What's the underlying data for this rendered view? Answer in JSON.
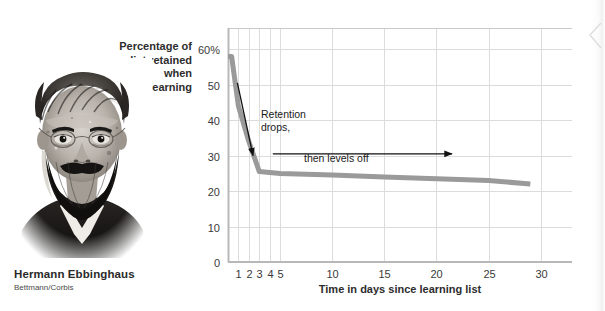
{
  "figure": {
    "portrait": {
      "alt": "portrait-hermann-ebbinghaus",
      "caption_name": "Hermann Ebbinghaus",
      "caption_credit": "Bettmann/Corbis"
    }
  },
  "chart_data": {
    "type": "line",
    "title": "",
    "xlabel": "Time in days since learning list",
    "ylabel": "Percentage of list retained when relearning",
    "ylabel_lines": [
      "Percentage of",
      "list retained",
      "when",
      "relearning"
    ],
    "xlim": [
      0,
      33
    ],
    "ylim": [
      0,
      66
    ],
    "grid": true,
    "legend": "none",
    "ytick_values": [
      0,
      10,
      20,
      30,
      40,
      50,
      60
    ],
    "ytick_labels": [
      "0",
      "10",
      "20",
      "30",
      "40",
      "50",
      "60%"
    ],
    "xtick_values": [
      1,
      2,
      3,
      4,
      5,
      10,
      15,
      20,
      25,
      30
    ],
    "xtick_labels": [
      "1",
      "2",
      "3",
      "4",
      "5",
      "10",
      "15",
      "20",
      "25",
      "30"
    ],
    "series": [
      {
        "name": "Percentage of list retained when relearning",
        "color": "#9a9a9a",
        "x": [
          0.0,
          0.35,
          1.0,
          2.0,
          3.0,
          5.0,
          10.0,
          15.0,
          20.0,
          25.0,
          29.0
        ],
        "values": [
          58.0,
          58.0,
          44.0,
          34.0,
          25.5,
          25.0,
          24.5,
          24.0,
          23.5,
          23.0,
          22.0
        ]
      }
    ],
    "annotations": [
      {
        "id": "retention-drops",
        "text_lines": [
          "Retention",
          "drops,"
        ],
        "arrow": {
          "from": [
            0.9,
            50.5
          ],
          "to": [
            2.4,
            30.0
          ]
        }
      },
      {
        "id": "then-levels-off",
        "text_lines": [
          "then levels off"
        ],
        "arrow": {
          "from": [
            4.3,
            30.5
          ],
          "to": [
            21.5,
            30.5
          ]
        }
      }
    ],
    "colors": {
      "series": "#9a9a9a",
      "grid": "#dcdcdc",
      "axis": "#b8b8b8",
      "annotation": "#1a1a1a",
      "text": "#2d2d2d"
    }
  }
}
